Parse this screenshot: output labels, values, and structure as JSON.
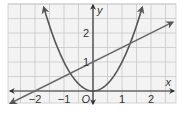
{
  "chart_data": {
    "type": "line",
    "title": "",
    "xlabel": "x",
    "ylabel": "y",
    "origin_label": "O",
    "xlim": [
      -2.95,
      2.85
    ],
    "ylim": [
      -0.4,
      3.0
    ],
    "grid": true,
    "grid_step": 0.5,
    "x_ticks": [
      {
        "value": -2,
        "label": "−2"
      },
      {
        "value": -1,
        "label": "−1"
      },
      {
        "value": 1,
        "label": "1"
      },
      {
        "value": 2,
        "label": "2"
      }
    ],
    "y_ticks": [
      {
        "value": 1,
        "label": "1"
      },
      {
        "value": 2,
        "label": "2"
      }
    ],
    "series": [
      {
        "name": "parabola",
        "equation": "y = x^2",
        "kind": "curve",
        "x_range": [
          -1.7,
          1.7
        ],
        "color": "#555555"
      },
      {
        "name": "line",
        "equation": "y = 0.5x + 1",
        "kind": "line",
        "x_range": [
          -2.85,
          2.75
        ],
        "color": "#6a6a6a"
      }
    ],
    "intersections": [
      [
        -0.78,
        0.61
      ],
      [
        1.28,
        1.64
      ]
    ]
  },
  "colors": {
    "grid": "#c8c8c8",
    "axis": "#333333",
    "curve": "#555555",
    "background": "#f3f3f3"
  }
}
